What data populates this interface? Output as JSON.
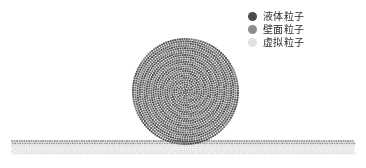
{
  "figure": {
    "background_color": "#ffffff",
    "width": 366,
    "height": 168
  },
  "legend": {
    "items": [
      {
        "label": "液体粒子",
        "marker": "filled-circle",
        "color": "#4a4a4a"
      },
      {
        "label": "壁面粒子",
        "marker": "filled-circle",
        "color": "#8d8d8d"
      },
      {
        "label": "虚拟粒子",
        "marker": "filled-circle",
        "color": "#e2e2e2"
      }
    ]
  },
  "chart_data": {
    "type": "scatter",
    "title": "",
    "xlabel": "",
    "ylabel": "",
    "grid": false,
    "legend_position": "top-right",
    "xlim": [
      0,
      366
    ],
    "ylim": [
      0,
      168
    ],
    "series": [
      {
        "name": "液体粒子",
        "color": "#4a4a4a",
        "shape": "disc",
        "center_x": 185.5,
        "center_y": 91.5,
        "radius": 52.5,
        "particle_size": 1.9,
        "ring_spacing": 2.35,
        "ring_count": 23,
        "approx_count": 1520,
        "description": "圆形液滴，由同心环排列的液体粒子组成，底部与壁面接触"
      },
      {
        "name": "壁面粒子",
        "color": "#9a9a9a",
        "shape": "row",
        "x_start": 12,
        "x_end": 355,
        "y_top": 141,
        "rows": 2,
        "row_spacing": 2.4,
        "column_spacing": 2.4,
        "particle_size": 1.9,
        "approx_count": 286,
        "description": "水平壁面顶部两行粒子"
      },
      {
        "name": "虚拟粒子",
        "color": "#dcdcdc",
        "shape": "row",
        "x_start": 12,
        "x_end": 355,
        "y_top": 146,
        "rows": 4,
        "row_spacing": 2.4,
        "column_spacing": 2.4,
        "particle_size": 1.9,
        "approx_count": 572,
        "description": "壁面下方的虚拟边界粒子层"
      }
    ]
  }
}
